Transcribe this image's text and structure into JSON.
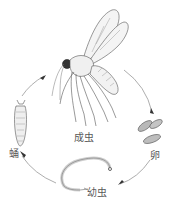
{
  "diagram": {
    "type": "life-cycle",
    "stages": [
      {
        "id": "adult",
        "label": "成虫"
      },
      {
        "id": "egg",
        "label": "卵"
      },
      {
        "id": "larva",
        "label": "幼虫"
      },
      {
        "id": "pupa",
        "label": "蛹"
      }
    ],
    "cycle_order": [
      "adult",
      "egg",
      "larva",
      "pupa",
      "adult"
    ],
    "colors": {
      "line": "#6a6a6a",
      "text": "#5a5a5a",
      "background": "#ffffff"
    }
  }
}
